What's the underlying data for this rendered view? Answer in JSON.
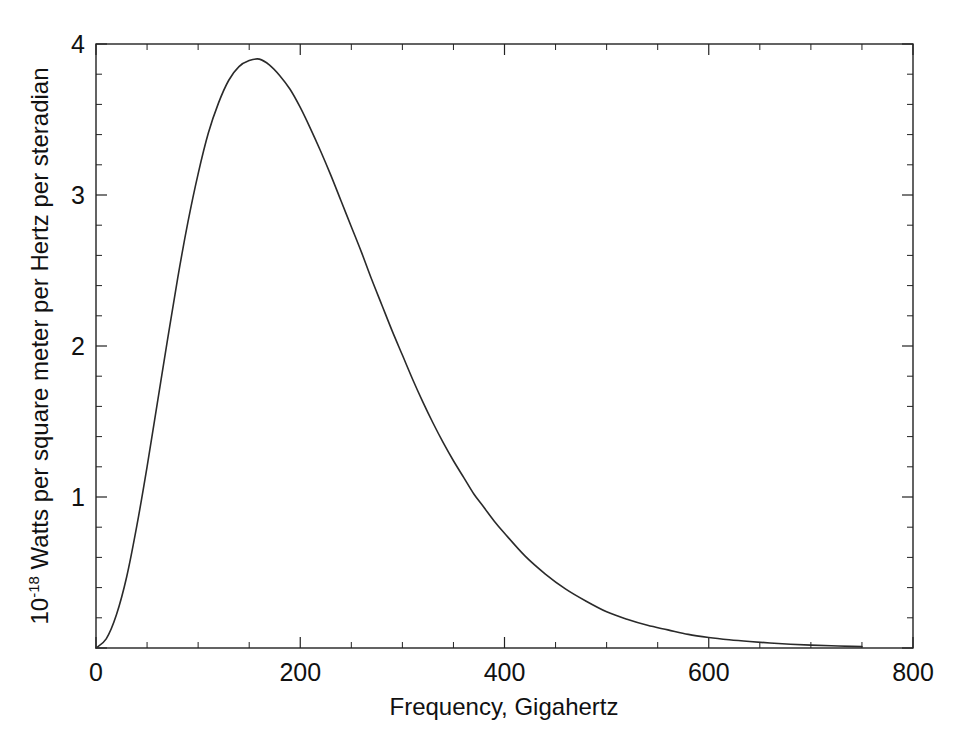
{
  "chart_data": {
    "type": "line",
    "title": "",
    "subtitle": "",
    "xlabel": "Frequency, Gigahertz",
    "ylabel": "10⁻¹⁸ Watts per square meter per Hertz per steradian",
    "ylabel_parts": {
      "mantissa": "10",
      "exponent": "-18",
      "rest": " Watts per square meter per Hertz per steradian"
    },
    "xlim": [
      0,
      800
    ],
    "ylim": [
      0,
      4
    ],
    "xticks": [
      0,
      200,
      400,
      600,
      800
    ],
    "xticklabels": [
      "0",
      "200",
      "400",
      "600",
      "800"
    ],
    "yticks": [
      0,
      1,
      2,
      3,
      4
    ],
    "yticklabels": [
      "",
      "1",
      "2",
      "3",
      "4"
    ],
    "x_minor_step": 50,
    "y_minor_step": 0.2,
    "grid": false,
    "legend": null,
    "legend_position": "none",
    "line_color": "#2a2a2a",
    "frame_color": "#222222",
    "background_color": "#ffffff",
    "peak": {
      "x": 160,
      "y": 3.9
    },
    "series": [
      {
        "name": "CMB blackbody spectrum",
        "x": [
          0,
          10,
          20,
          30,
          40,
          50,
          60,
          70,
          80,
          90,
          100,
          110,
          120,
          130,
          140,
          150,
          160,
          170,
          180,
          190,
          200,
          210,
          220,
          230,
          240,
          250,
          260,
          270,
          280,
          290,
          300,
          310,
          320,
          330,
          340,
          350,
          360,
          370,
          380,
          390,
          400,
          420,
          440,
          460,
          480,
          500,
          520,
          540,
          560,
          580,
          600,
          620,
          640,
          660,
          680,
          700,
          720,
          740,
          750
        ],
        "y": [
          0.0,
          0.06,
          0.22,
          0.47,
          0.81,
          1.2,
          1.62,
          2.04,
          2.45,
          2.82,
          3.14,
          3.41,
          3.61,
          3.76,
          3.85,
          3.89,
          3.9,
          3.86,
          3.79,
          3.7,
          3.58,
          3.44,
          3.29,
          3.13,
          2.96,
          2.79,
          2.62,
          2.44,
          2.27,
          2.1,
          1.94,
          1.78,
          1.63,
          1.49,
          1.36,
          1.24,
          1.13,
          1.02,
          0.93,
          0.84,
          0.76,
          0.61,
          0.49,
          0.39,
          0.31,
          0.24,
          0.19,
          0.15,
          0.12,
          0.09,
          0.07,
          0.055,
          0.043,
          0.033,
          0.025,
          0.019,
          0.015,
          0.011,
          0.009
        ]
      }
    ]
  },
  "plot_geometry": {
    "left": 96,
    "right": 913,
    "top": 44,
    "bottom": 648
  }
}
